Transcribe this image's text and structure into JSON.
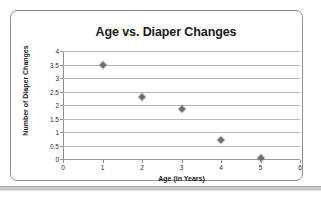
{
  "chart_data": {
    "type": "scatter",
    "title": "Age vs. Diaper Changes",
    "xlabel": "Age (in Years)",
    "ylabel": "Number of Diaper Changes",
    "xlim": [
      0,
      6
    ],
    "ylim": [
      0,
      4
    ],
    "xticks": [
      "0",
      "1",
      "2",
      "3",
      "4",
      "5",
      "6"
    ],
    "yticks": [
      "0",
      "0.5",
      "1",
      "1.5",
      "2",
      "2.5",
      "3",
      "3.5",
      "4"
    ],
    "grid": "horizontal",
    "legend": "none",
    "marker": "diamond",
    "marker_color": "#6e6e6e",
    "gridline_color": "#b7b7b7",
    "series": [
      {
        "name": "Diaper Changes",
        "points": [
          {
            "x": 1,
            "y": 3.5
          },
          {
            "x": 2,
            "y": 2.3
          },
          {
            "x": 3,
            "y": 1.85
          },
          {
            "x": 4,
            "y": 0.7
          },
          {
            "x": 5,
            "y": 0.05
          }
        ]
      }
    ]
  }
}
